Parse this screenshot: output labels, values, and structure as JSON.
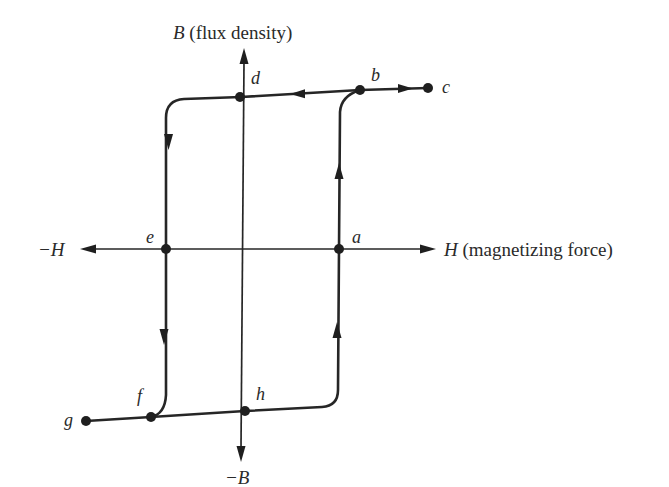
{
  "figure": {
    "axes": {
      "vertical": {
        "positive_symbol": "B",
        "positive_desc": " (flux density)",
        "negative_label": "−B"
      },
      "horizontal": {
        "positive_symbol": "H",
        "positive_desc": " (magnetizing force)",
        "negative_label": "−H"
      }
    },
    "points": {
      "a": "a",
      "b": "b",
      "c": "c",
      "d": "d",
      "e": "e",
      "f": "f",
      "g": "g",
      "h": "h"
    },
    "path_order": [
      "a",
      "b",
      "c",
      "b",
      "d",
      "e",
      "f",
      "g",
      "f",
      "h",
      "a"
    ],
    "colors": {
      "line": "#262626",
      "text": "#2a2a2a",
      "background": "#ffffff"
    }
  }
}
